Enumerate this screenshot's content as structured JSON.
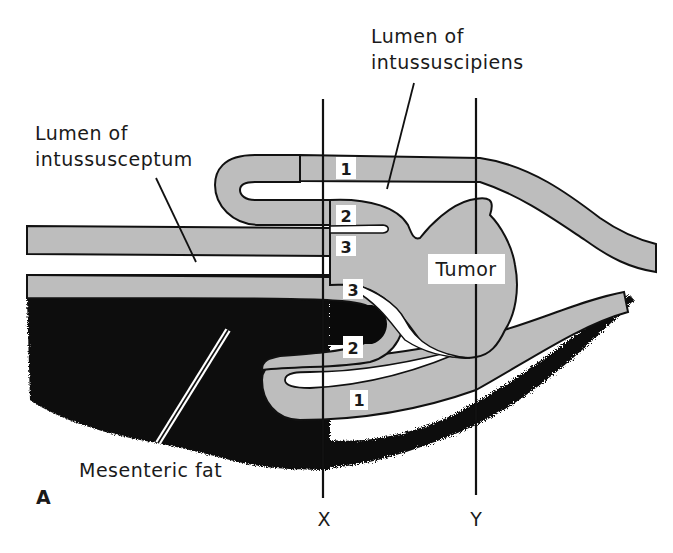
{
  "figure": {
    "panel_label": "A",
    "labels": {
      "lumen_intussusceptum_line1": "Lumen of",
      "lumen_intussusceptum_line2": "intussusceptum",
      "lumen_intussuscipiens_line1": "Lumen of",
      "lumen_intussuscipiens_line2": "intussuscipiens",
      "tumor": "Tumor",
      "mesenteric_fat": "Mesenteric fat"
    },
    "section_lines": [
      {
        "name": "X",
        "x": 323
      },
      {
        "name": "Y",
        "x": 476
      }
    ],
    "layer_numbers": {
      "top_1": "1",
      "top_2": "2",
      "top_3": "3",
      "bottom_3": "3",
      "bottom_2": "2",
      "bottom_1": "1"
    },
    "colors": {
      "wall_gray": "#bdbdbd",
      "fat_black": "#0a0a0a",
      "outline": "#111111",
      "background": "#ffffff"
    }
  }
}
